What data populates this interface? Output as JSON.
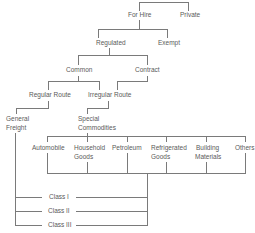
{
  "diagram": {
    "type": "tree",
    "nodes": {
      "for_hire": "For Hire",
      "private": "Private",
      "regulated": "Regulated",
      "exempt": "Exempt",
      "common": "Common",
      "contract": "Contract",
      "regular_route": "Regular Route",
      "irregular_route": "Irregular Route",
      "general_freight_1": "General",
      "general_freight_2": "Freight",
      "special_commodities_1": "Special",
      "special_commodities_2": "Commodities",
      "automobile": "Automobile",
      "household_1": "Household",
      "household_2": "Goods",
      "petroleum": "Petroleum",
      "refrigerated_1": "Refrigerated",
      "refrigerated_2": "Goods",
      "building_1": "Building",
      "building_2": "Materials",
      "others": "Others",
      "class_1": "Class I",
      "class_2": "Class II",
      "class_3": "Class III"
    },
    "edges": [
      [
        "root",
        "for_hire"
      ],
      [
        "root",
        "private"
      ],
      [
        "for_hire",
        "regulated"
      ],
      [
        "for_hire",
        "exempt"
      ],
      [
        "regulated",
        "common"
      ],
      [
        "regulated",
        "contract"
      ],
      [
        "common",
        "regular_route"
      ],
      [
        "common",
        "irregular_route"
      ],
      [
        "contract",
        "irregular_route"
      ],
      [
        "regular_route",
        "general_freight"
      ],
      [
        "irregular_route",
        "special_commodities"
      ],
      [
        "special_commodities",
        "automobile"
      ],
      [
        "special_commodities",
        "household_goods"
      ],
      [
        "special_commodities",
        "petroleum"
      ],
      [
        "special_commodities",
        "refrigerated_goods"
      ],
      [
        "special_commodities",
        "building_materials"
      ],
      [
        "special_commodities",
        "others"
      ],
      [
        "general_freight",
        "class_1"
      ],
      [
        "general_freight",
        "class_2"
      ],
      [
        "general_freight",
        "class_3"
      ],
      [
        "commodity_group",
        "class_1"
      ],
      [
        "commodity_group",
        "class_2"
      ],
      [
        "commodity_group",
        "class_3"
      ]
    ]
  }
}
